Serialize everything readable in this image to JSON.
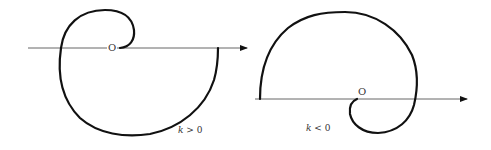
{
  "figures": [
    {
      "id": "left",
      "origin_label": "O",
      "caption": "k > 0",
      "caption_var": "k",
      "caption_rel": "> 0"
    },
    {
      "id": "right",
      "origin_label": "O",
      "caption": "k < 0",
      "caption_var": "k",
      "caption_rel": "< 0"
    }
  ],
  "colors": {
    "curve": "#111111",
    "axis": "#555555",
    "text": "#333333"
  }
}
